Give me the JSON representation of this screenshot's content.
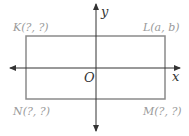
{
  "diagram": {
    "type": "coordinate-plane-rectangle",
    "colors": {
      "axis": "#333333",
      "rectangle": "#8a8a8a",
      "point_label": "#9a9a9a",
      "background": "#ffffff"
    },
    "axes": {
      "x_label": "x",
      "y_label": "y",
      "origin_label": "O"
    },
    "vertices": {
      "K": {
        "label": "K(?, ?)"
      },
      "L": {
        "label": "L(a, b)"
      },
      "M": {
        "label": "M(?, ?)"
      },
      "N": {
        "label": "N(?, ?)"
      }
    }
  }
}
